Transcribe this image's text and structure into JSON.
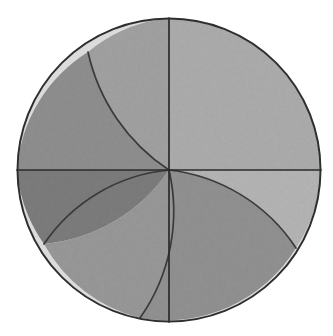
{
  "figure": {
    "title": "Shaded circle partitioned by diameters and arcs",
    "background_color": "#ffffff",
    "outline_color": "#2e2e2e",
    "divider_color": "#2b2b2b",
    "arc_color": "#3a3a3a"
  },
  "chart_data": {
    "type": "diagram",
    "title": "Shaded circle partitioned by diameters and arcs",
    "canvas": {
      "width": 333,
      "height": 336
    },
    "circle": {
      "cx": 169,
      "cy": 170,
      "r": 152
    },
    "dividers": [
      {
        "name": "vertical-diameter",
        "x1": 169,
        "y1": 18,
        "x2": 169,
        "y2": 322
      },
      {
        "name": "horizontal-diameter",
        "x1": 17,
        "y1": 170,
        "x2": 321,
        "y2": 170
      }
    ],
    "arcs": [
      {
        "name": "arc-upper-left",
        "from": [
          88,
          52
        ],
        "to": [
          169,
          170
        ],
        "bulge": "toward upper-right"
      },
      {
        "name": "arc-lower-left-west",
        "from": [
          44,
          244
        ],
        "to": [
          169,
          170
        ],
        "bulge": "toward lower-left"
      },
      {
        "name": "arc-lower-left-south",
        "from": [
          140,
          318
        ],
        "to": [
          169,
          170
        ],
        "bulge": "toward right"
      },
      {
        "name": "arc-lower-right",
        "from": [
          169,
          170
        ],
        "to": [
          296,
          248
        ],
        "bulge": "toward upper-right"
      }
    ],
    "regions": [
      {
        "id": "upper-right-quadrant",
        "label": "Upper right quadrant",
        "gray": "#b9b9b9",
        "value": 185
      },
      {
        "id": "upper-left-inner-wedge",
        "label": "Upper left inner wedge",
        "gray": "#a8a8a8",
        "value": 168
      },
      {
        "id": "upper-left-outer-wedge",
        "label": "Upper left outer wedge",
        "gray": "#8b8b8b",
        "value": 139
      },
      {
        "id": "lower-left-dark-wedge",
        "label": "Lower left dark wedge",
        "gray": "#6e6e6e",
        "value": 110
      },
      {
        "id": "lower-left-lens",
        "label": "Lower left lens region",
        "gray": "#9a9a9a",
        "value": 154
      },
      {
        "id": "lower-right-lens",
        "label": "Lower right lens region",
        "gray": "#8f8f8f",
        "value": 143
      },
      {
        "id": "lower-right-light-sliver",
        "label": "Lower right light sliver",
        "gray": "#c6c6c6",
        "value": 198
      }
    ],
    "legend": {
      "visible": false
    },
    "axes": {
      "visible": false
    },
    "grid": false
  }
}
